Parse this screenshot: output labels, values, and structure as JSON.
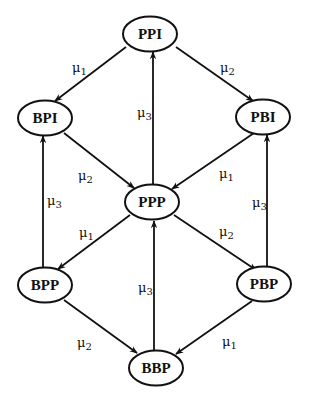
{
  "diagram": {
    "type": "state-transition",
    "nodes": [
      {
        "id": "PPI",
        "label": "PPI"
      },
      {
        "id": "BPI",
        "label": "BPI"
      },
      {
        "id": "PBI",
        "label": "PBI"
      },
      {
        "id": "PPP",
        "label": "PPP"
      },
      {
        "id": "BPP",
        "label": "BPP"
      },
      {
        "id": "PBP",
        "label": "PBP"
      },
      {
        "id": "BBP",
        "label": "BBP"
      }
    ],
    "edges": [
      {
        "from": "PPI",
        "to": "BPI",
        "label": "μ",
        "sub": "1"
      },
      {
        "from": "PPI",
        "to": "PBI",
        "label": "μ",
        "sub": "2"
      },
      {
        "from": "PPP",
        "to": "PPI",
        "label": "μ",
        "sub": "3"
      },
      {
        "from": "BPI",
        "to": "PPP",
        "label": "μ",
        "sub": "2"
      },
      {
        "from": "PBI",
        "to": "PPP",
        "label": "μ",
        "sub": "1"
      },
      {
        "from": "BPP",
        "to": "BPI",
        "label": "μ",
        "sub": "3"
      },
      {
        "from": "PBP",
        "to": "PBI",
        "label": "μ",
        "sub": "3"
      },
      {
        "from": "PPP",
        "to": "BPP",
        "label": "μ",
        "sub": "1"
      },
      {
        "from": "PPP",
        "to": "PBP",
        "label": "μ",
        "sub": "2"
      },
      {
        "from": "BBP",
        "to": "PPP",
        "label": "μ",
        "sub": "3"
      },
      {
        "from": "BPP",
        "to": "BBP",
        "label": "μ",
        "sub": "2"
      },
      {
        "from": "PBP",
        "to": "BBP",
        "label": "μ",
        "sub": "1"
      }
    ]
  }
}
